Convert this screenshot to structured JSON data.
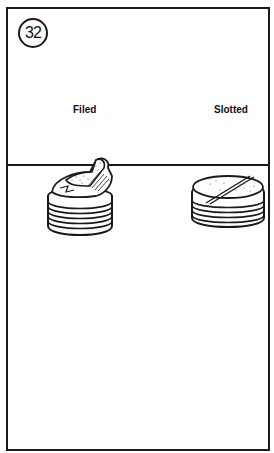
{
  "figure": {
    "number": "32",
    "labels": {
      "left": "Filed",
      "right": "Slotted"
    },
    "items": [
      {
        "name": "filed-plug",
        "description": "threaded pipe plug with filed-down top"
      },
      {
        "name": "slotted-plug",
        "description": "threaded plug with slot cut across top"
      }
    ],
    "colors": {
      "ink": "#1a1a1a",
      "background": "#ffffff"
    }
  }
}
